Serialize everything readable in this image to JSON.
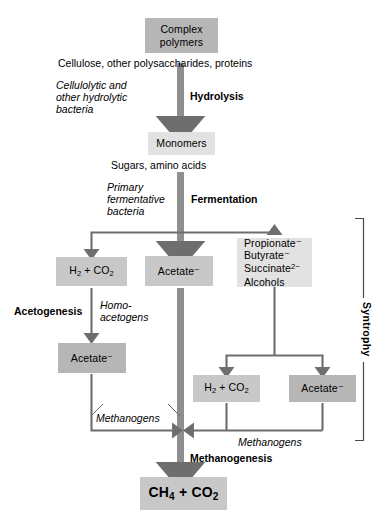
{
  "diagram": {
    "colors": {
      "box_dark": "#b6b6b6",
      "box_mid": "#c8c8c8",
      "box_light": "#e2e2e2",
      "arrow_dark": "#6e6e6e",
      "arrow_light": "#8f8f8f",
      "text": "#000000",
      "background": "#ffffff"
    },
    "boxes": {
      "complex_polymers": {
        "line1": "Complex",
        "line2": "polymers"
      },
      "monomers": {
        "line1": "Monomers"
      },
      "h2_co2_top": {
        "line1": "H₂ + CO₂"
      },
      "acetate_mid": {
        "line1": "Acetate⁻"
      },
      "organic_acids": {
        "line1": "Propionate⁻",
        "line2": "Butyrate⁻",
        "line3": "Succinate²⁻",
        "line4": "Alcohols"
      },
      "acetate_acetogenesis": {
        "line1": "Acetate⁻"
      },
      "h2_co2_bottom": {
        "line1": "H₂ + CO₂"
      },
      "acetate_bottom": {
        "line1": "Acetate⁻"
      },
      "methane": {
        "line1": "CH₄ + CO₂"
      }
    },
    "captions": {
      "substrates_polymers": "Cellulose, other polysaccharides, proteins",
      "organisms_hydrolytic_l1": "Cellulolytic and",
      "organisms_hydrolytic_l2": "other hydrolytic",
      "organisms_hydrolytic_l3": "bacteria",
      "process_hydrolysis": "Hydrolysis",
      "substrates_monomers": "Sugars, amino acids",
      "organisms_fermentative_l1": "Primary",
      "organisms_fermentative_l2": "fermentative",
      "organisms_fermentative_l3": "bacteria",
      "process_fermentation": "Fermentation",
      "process_acetogenesis": "Acetogenesis",
      "organisms_homoacetogens_l1": "Homo-",
      "organisms_homoacetogens_l2": "acetogens",
      "organisms_methanogens_left": "Methanogens",
      "organisms_methanogens_right": "Methanogens",
      "process_methanogenesis": "Methanogenesis",
      "bracket_syntrophy": "Syntrophy"
    }
  }
}
